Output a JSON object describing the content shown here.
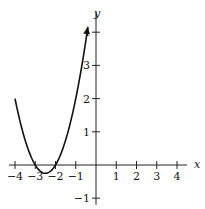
{
  "chart_data": {
    "type": "line",
    "title": "",
    "xlabel": "x",
    "ylabel": "y",
    "xlim": [
      -4.3,
      4.5
    ],
    "ylim": [
      -1.2,
      4.6
    ],
    "x_ticks": [
      -4,
      -3,
      -2,
      -1,
      1,
      2,
      3,
      4
    ],
    "y_ticks": [
      -1,
      1,
      2,
      3,
      4
    ],
    "x_tick_labels": [
      "−4",
      "−3",
      "−2",
      "−1",
      "1",
      "2",
      "3",
      "4"
    ],
    "y_tick_labels": [
      "−1",
      "1",
      "2",
      "3",
      "4"
    ],
    "grid": false,
    "series": [
      {
        "name": "y = (x+3)(x+2)",
        "x": [
          -4,
          -3.5,
          -3,
          -2.75,
          -2.5,
          -2.25,
          -2,
          -1.5,
          -1,
          -0.5,
          -0.4
        ],
        "y": [
          2,
          0.75,
          0,
          -0.19,
          -0.25,
          -0.19,
          0,
          0.75,
          2,
          3.75,
          4.16
        ],
        "start": "point",
        "end": "arrow"
      }
    ],
    "annotations": []
  }
}
